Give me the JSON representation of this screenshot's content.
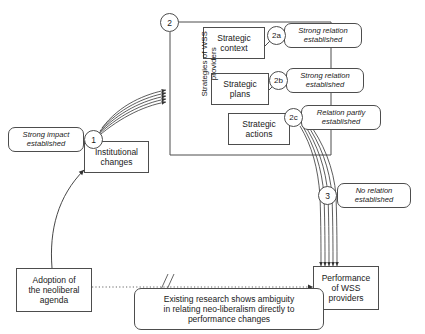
{
  "diagram": {
    "background_color": "#ffffff",
    "line_color": "#4d4d4d",
    "text_color": "#1a1a1a"
  },
  "nodes": {
    "strong_impact": {
      "label": "Strong impact\nestablished",
      "style": "rounded-italic"
    },
    "institutional_changes": {
      "label": "Institutional\nchanges",
      "style": "rect"
    },
    "strategic_context": {
      "label": "Strategic\ncontext",
      "style": "rect"
    },
    "strategic_plans": {
      "label": "Strategic\nplans",
      "style": "rect"
    },
    "strategic_actions": {
      "label": "Strategic\nactions",
      "style": "rect"
    },
    "relation_2a": {
      "label": "Strong relation\nestablished",
      "style": "rounded-italic"
    },
    "relation_2b": {
      "label": "Strong relation\nestablished",
      "style": "rounded-italic"
    },
    "relation_2c": {
      "label": "Relation partly\nestablished",
      "style": "rounded-italic"
    },
    "relation_3": {
      "label": "No relation\nestablished",
      "style": "rounded-italic"
    },
    "adoption": {
      "label": "Adoption of\nthe neoliberal\nagenda",
      "style": "rect"
    },
    "performance": {
      "label": "Performance\nof WSS\nproviders",
      "style": "rect"
    },
    "ambiguity_note": {
      "label": "Existing research shows ambiguity\nin relating neo-liberalism directly to\nperformance changes",
      "style": "rounded"
    }
  },
  "group": {
    "vertical_label": "Strategies of WSS\nproviders"
  },
  "markers": {
    "m1": "1",
    "m2": "2",
    "m2a": "2a",
    "m2b": "2b",
    "m2c": "2c",
    "m3": "3"
  }
}
